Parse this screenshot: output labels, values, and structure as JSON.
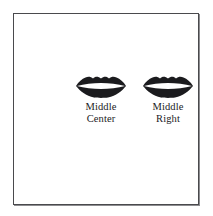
{
  "diagram": {
    "background_color": "#ffffff",
    "frame_color": "#4a4a4d",
    "items": [
      {
        "icon": "lips-icon",
        "label_line1": "Middle",
        "label_line2": "Center",
        "icon_fill": "#1b1b1e",
        "icon_slit": "#ffffff"
      },
      {
        "icon": "lips-icon",
        "label_line1": "Middle",
        "label_line2": "Right",
        "icon_fill": "#1b1b1e",
        "icon_slit": "#ffffff"
      }
    ]
  }
}
